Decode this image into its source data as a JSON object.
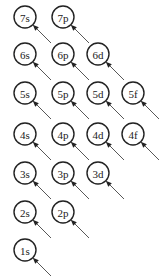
{
  "colors": {
    "stroke": "#222222",
    "arrow": "#444444",
    "background": "#ffffff"
  },
  "orbitals": [
    {
      "label": "7s",
      "cx": 25,
      "cy": 17
    },
    {
      "label": "7p",
      "cx": 63,
      "cy": 17
    },
    {
      "label": "6s",
      "cx": 25,
      "cy": 54
    },
    {
      "label": "6p",
      "cx": 63,
      "cy": 54
    },
    {
      "label": "6d",
      "cx": 98,
      "cy": 54
    },
    {
      "label": "5s",
      "cx": 25,
      "cy": 93
    },
    {
      "label": "5p",
      "cx": 63,
      "cy": 93
    },
    {
      "label": "5d",
      "cx": 98,
      "cy": 93
    },
    {
      "label": "5f",
      "cx": 133,
      "cy": 93
    },
    {
      "label": "4s",
      "cx": 25,
      "cy": 134
    },
    {
      "label": "4p",
      "cx": 63,
      "cy": 134
    },
    {
      "label": "4d",
      "cx": 98,
      "cy": 134
    },
    {
      "label": "4f",
      "cx": 133,
      "cy": 134
    },
    {
      "label": "3s",
      "cx": 25,
      "cy": 173
    },
    {
      "label": "3p",
      "cx": 63,
      "cy": 173
    },
    {
      "label": "3d",
      "cx": 98,
      "cy": 173
    },
    {
      "label": "2s",
      "cx": 25,
      "cy": 212
    },
    {
      "label": "2p",
      "cx": 63,
      "cy": 212
    },
    {
      "label": "1s",
      "cx": 25,
      "cy": 250
    }
  ],
  "arrow_note": "Each orbital has a diagonal arrow pointing into it from the lower right"
}
